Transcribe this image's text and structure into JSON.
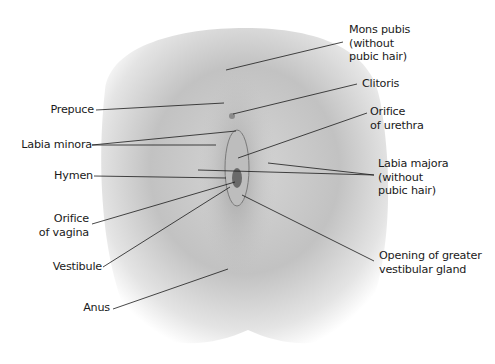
{
  "diagram": {
    "colors": {
      "background": "#ffffff",
      "line": "#1a1a1a",
      "text": "#1a1a1a",
      "shade": "#9a9a9a"
    },
    "labels_left": [
      {
        "id": "prepuce",
        "text": "Prepuce"
      },
      {
        "id": "labia-minora",
        "text": "Labia minora"
      },
      {
        "id": "hymen",
        "text": "Hymen"
      },
      {
        "id": "orifice-vagina",
        "text": "Orifice\nof vagina"
      },
      {
        "id": "vestibule",
        "text": "Vestibule"
      },
      {
        "id": "anus",
        "text": "Anus"
      }
    ],
    "labels_right": [
      {
        "id": "mons-pubis",
        "text": "Mons pubis\n(without\npubic hair)"
      },
      {
        "id": "clitoris",
        "text": "Clitoris"
      },
      {
        "id": "orifice-urethra",
        "text": "Orifice\nof urethra"
      },
      {
        "id": "labia-majora",
        "text": "Labia majora\n(without\npubic hair)"
      },
      {
        "id": "greater-vestibular-gland",
        "text": "Opening of greater\nvestibular gland"
      }
    ]
  }
}
